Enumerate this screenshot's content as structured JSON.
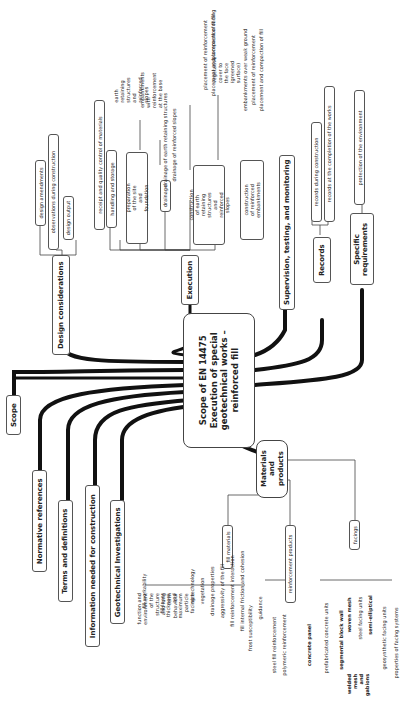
{
  "central": {
    "label": "Scope of EN 14475\nExecution of special\ngeotechnical works –\nreinforced fill"
  },
  "left_branches": [
    {
      "label": "Scope"
    },
    {
      "label": "Normative references"
    },
    {
      "label": "Terms and definitions"
    },
    {
      "label": "Information needed for construction"
    },
    {
      "label": "Geotechnical Investigations"
    }
  ],
  "design": {
    "label": "Design considerations",
    "children": [
      {
        "label": "design amendments"
      },
      {
        "label": "observations during construction"
      },
      {
        "label": "design output"
      }
    ]
  },
  "execution": {
    "label": "Execution",
    "children": [
      {
        "label": "receipt and quality control of materials"
      },
      {
        "label": "handling and storage"
      },
      {
        "label": "preparation of the site and foundation",
        "children": [
          {
            "label": "earth retaining structures and reinforced slopes"
          },
          {
            "label": "embankments with reinforcement at the base"
          }
        ]
      },
      {
        "label": "drainage",
        "children": [
          {
            "label": "drainage of earth retaining structures"
          },
          {
            "label": "drainage of reinforced slopes"
          }
        ]
      },
      {
        "label": "construction of earth retaining structures and reinforced slopes",
        "children": [
          {
            "label": "placement of facing"
          },
          {
            "label": "placement of reinforcement"
          },
          {
            "label": "placement and compaction of fill"
          },
          {
            "label": "vegetative cover to the face (greened surface)"
          }
        ]
      },
      {
        "label": "construction of reinforced embankments",
        "children": [
          {
            "label": "embankments over weak ground"
          },
          {
            "label": "placement of reinforcement"
          },
          {
            "label": "placement and compaction of fill"
          }
        ]
      }
    ]
  },
  "supervision": {
    "label": "Supervision, testing, and monitoring"
  },
  "records": {
    "label": "Records",
    "children": [
      {
        "label": "records during construction"
      },
      {
        "label": "records at the completion of the works"
      }
    ]
  },
  "specific": {
    "label": "Specific requirements",
    "children": [
      {
        "label": "protection of the environment"
      }
    ]
  },
  "materials": {
    "label": "Materials and products",
    "fill_materials": {
      "label": "fill materials",
      "children": [
        {
          "label": "fill workability"
        },
        {
          "label": "function and environment of the structure and long term behaviour"
        },
        {
          "label": "fill layer thickness and maximum particle size"
        },
        {
          "label": "facing technology"
        },
        {
          "label": "vegetation"
        },
        {
          "label": "drainage properties"
        },
        {
          "label": "aggressivity of the fill"
        },
        {
          "label": "fill reinforcement interaction"
        },
        {
          "label": "fill internal friction and cohesion"
        },
        {
          "label": "frost susceptibility"
        },
        {
          "label": "guidance"
        }
      ]
    },
    "reinforcement_products": {
      "label": "reinforcement products",
      "children": [
        {
          "label": "steel fill reinforcement"
        },
        {
          "label": "polymeric reinforcement"
        }
      ]
    },
    "facings": {
      "label": "facings",
      "children": [
        {
          "label": "prefabricated concrete units"
        },
        {
          "label": "concrete panel"
        },
        {
          "label": "segmental block wall"
        },
        {
          "label": "woven mesh"
        },
        {
          "label": "steel facing units"
        },
        {
          "label": "welded mesh and gabions"
        },
        {
          "label": "semi-elliptical"
        },
        {
          "label": "geosynthetic facing units"
        },
        {
          "label": "properties of facing systems"
        }
      ]
    }
  }
}
